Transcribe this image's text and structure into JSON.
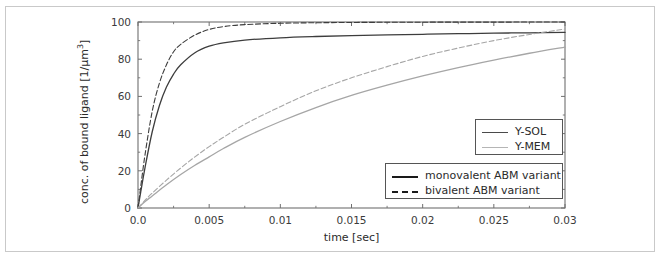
{
  "figure": {
    "background_color": "#ffffff",
    "frame_color": "#c9c9c9",
    "axis_color": "#6f6f6f"
  },
  "chart_data": {
    "type": "line",
    "title": "",
    "subtitle": "",
    "xlabel": "time [sec]",
    "ylabel": "conc. of bound ligand [1/μm³]",
    "ylabel_html": "conc. of bound ligand [1/μm<sup>3</sup>]",
    "xlim": [
      0.0,
      0.03
    ],
    "ylim": [
      0,
      100
    ],
    "grid": false,
    "xticks": [
      0.0,
      0.005,
      0.01,
      0.015,
      0.02,
      0.025,
      0.03
    ],
    "xtick_labels": [
      "0.0",
      "0.005",
      "0.01",
      "0.015",
      "0.02",
      "0.025",
      "0.03"
    ],
    "yticks": [
      0,
      20,
      40,
      60,
      80,
      100
    ],
    "ytick_labels": [
      "0",
      "20",
      "40",
      "60",
      "80",
      "100"
    ],
    "x_minor_ticks": [
      0.0025,
      0.0075,
      0.0125,
      0.0175,
      0.0225,
      0.0275
    ],
    "y_minor_ticks": [
      10,
      30,
      50,
      70,
      90
    ],
    "legend_position": "lower right",
    "series": [
      {
        "name": "Y-SOL monovalent ABM variant",
        "color_key": "y_sol",
        "color": "#3d3d3d",
        "dash": "solid",
        "x": [
          0.0,
          0.0002,
          0.0005,
          0.001,
          0.0015,
          0.002,
          0.0025,
          0.003,
          0.004,
          0.005,
          0.006,
          0.0075,
          0.01,
          0.0125,
          0.015,
          0.0175,
          0.02,
          0.0225,
          0.025,
          0.0275,
          0.03
        ],
        "values": [
          0,
          9,
          22,
          41,
          55,
          65,
          72,
          77,
          83.5,
          87,
          88.8,
          90.3,
          91.5,
          92.2,
          92.7,
          93.1,
          93.4,
          93.7,
          94.0,
          94.2,
          94.4
        ]
      },
      {
        "name": "Y-SOL bivalent ABM variant",
        "color_key": "y_sol",
        "color": "#3d3d3d",
        "dash": "dashed",
        "x": [
          0.0,
          0.0002,
          0.0005,
          0.001,
          0.0015,
          0.002,
          0.0025,
          0.003,
          0.004,
          0.005,
          0.006,
          0.0075,
          0.01,
          0.0125,
          0.015,
          0.0175,
          0.02,
          0.0225,
          0.025,
          0.0275,
          0.03
        ],
        "values": [
          0,
          12,
          29,
          52,
          67,
          77,
          84,
          88,
          93,
          96,
          97.5,
          98.6,
          99.3,
          99.6,
          99.75,
          99.85,
          99.9,
          99.93,
          99.95,
          99.97,
          99.98
        ]
      },
      {
        "name": "Y-MEM monovalent ABM variant",
        "color_key": "y_mem",
        "color": "#a6a6a6",
        "dash": "solid",
        "x": [
          0.0,
          0.0005,
          0.001,
          0.002,
          0.003,
          0.004,
          0.005,
          0.006,
          0.0075,
          0.01,
          0.0125,
          0.015,
          0.0175,
          0.02,
          0.0225,
          0.025,
          0.0275,
          0.03
        ],
        "values": [
          0,
          3.5,
          6.5,
          12.5,
          18,
          23,
          27.5,
          32,
          38,
          46.5,
          54,
          60.5,
          66,
          71,
          75.5,
          79.5,
          83.2,
          86.5
        ]
      },
      {
        "name": "Y-MEM bivalent ABM variant",
        "color_key": "y_mem",
        "color": "#a6a6a6",
        "dash": "dashed",
        "x": [
          0.0,
          0.0005,
          0.001,
          0.002,
          0.003,
          0.004,
          0.005,
          0.006,
          0.0075,
          0.01,
          0.0125,
          0.015,
          0.0175,
          0.02,
          0.0225,
          0.025,
          0.0275,
          0.03
        ],
        "values": [
          0,
          4.2,
          8.0,
          15.0,
          21.5,
          27.5,
          33,
          38,
          45,
          54.5,
          63,
          70,
          76,
          81.5,
          86,
          90,
          93.3,
          96.2
        ]
      }
    ]
  },
  "legend_color": {
    "legend_color_title": "",
    "border_color": "#555555",
    "entries": [
      {
        "label": "Y-SOL",
        "color": "#4a4a4a",
        "dash": "solid"
      },
      {
        "label": "Y-MEM",
        "color": "#b5b5b5",
        "dash": "solid"
      }
    ]
  },
  "legend_style": {
    "border_color": "#555555",
    "entries": [
      {
        "label": "monovalent ABM variant",
        "color": "#1a1a1a",
        "dash": "solid"
      },
      {
        "label": "bivalent ABM variant",
        "color": "#1a1a1a",
        "dash": "dashed"
      }
    ]
  }
}
